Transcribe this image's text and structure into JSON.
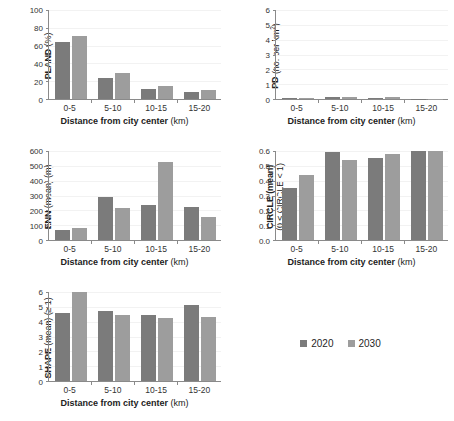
{
  "legend": {
    "items": [
      {
        "label": "2020",
        "color": "#7b7b7b",
        "name": "legend-2020"
      },
      {
        "label": "2030",
        "color": "#9d9d9d",
        "name": "legend-2030"
      }
    ]
  },
  "shared": {
    "categories": [
      "0-5",
      "5-10",
      "10-15",
      "15-20"
    ],
    "xlabel_bold": "Distance from city center",
    "xlabel_unit": "(km)"
  },
  "chart_data": [
    {
      "type": "bar",
      "id": "pland",
      "title": "",
      "ylabel_bold": "PLAND",
      "ylabel_unit": "(%)",
      "xlabel": "Distance from city center (km)",
      "categories": [
        "0-5",
        "5-10",
        "10-15",
        "15-20"
      ],
      "series": [
        {
          "name": "2020",
          "values": [
            64,
            24,
            11,
            8
          ]
        },
        {
          "name": "2030",
          "values": [
            70.5,
            29,
            14.5,
            10.5
          ]
        }
      ],
      "ylim": [
        0,
        100
      ],
      "yticks": [
        0,
        20,
        40,
        60,
        80,
        100
      ],
      "ytick_labels": [
        "0",
        "20",
        "40",
        "60",
        "80",
        "100"
      ],
      "grid": true,
      "legend_position": "external-bottom-right"
    },
    {
      "type": "bar",
      "id": "pd",
      "title": "",
      "ylabel_bold": "PD",
      "ylabel_unit": "(no. per km2)",
      "xlabel": "Distance from city center (km)",
      "categories": [
        "0-5",
        "5-10",
        "10-15",
        "15-20"
      ],
      "series": [
        {
          "name": "2020",
          "values": [
            0.05,
            0.12,
            0.09,
            0.03
          ]
        },
        {
          "name": "2030",
          "values": [
            0.04,
            0.15,
            0.11,
            0.03
          ]
        }
      ],
      "ylim": [
        0,
        6
      ],
      "yticks": [
        0,
        1,
        2,
        3,
        4,
        5,
        6
      ],
      "ytick_labels": [
        "0",
        "1",
        "2",
        "3",
        "4",
        "5",
        "6"
      ],
      "grid": true,
      "legend_position": "external-bottom-right"
    },
    {
      "type": "bar",
      "id": "enn",
      "title": "",
      "ylabel_bold": "ENN",
      "ylabel_unit": "(mean) (m)",
      "xlabel": "Distance from city center (km)",
      "categories": [
        "0-5",
        "5-10",
        "10-15",
        "15-20"
      ],
      "series": [
        {
          "name": "2020",
          "values": [
            70,
            292,
            233,
            223
          ]
        },
        {
          "name": "2030",
          "values": [
            80,
            215,
            523,
            152
          ]
        }
      ],
      "ylim": [
        0,
        600
      ],
      "yticks": [
        0,
        100,
        200,
        300,
        400,
        500,
        600
      ],
      "ytick_labels": [
        "0",
        "100",
        "200",
        "300",
        "400",
        "500",
        "600"
      ],
      "grid": true,
      "legend_position": "external-bottom-right"
    },
    {
      "type": "bar",
      "id": "circle",
      "title": "",
      "ylabel_bold": "CIRCLE (mean)",
      "ylabel_unit": "(0 ≤ CIRCLE < 1)",
      "xlabel": "Distance from city center (km)",
      "categories": [
        "0-5",
        "5-10",
        "10-15",
        "15-20"
      ],
      "series": [
        {
          "name": "2020",
          "values": [
            0.35,
            0.595,
            0.553,
            0.6
          ]
        },
        {
          "name": "2030",
          "values": [
            0.435,
            0.537,
            0.578,
            0.6
          ]
        }
      ],
      "ylim": [
        0,
        0.6
      ],
      "yticks": [
        0,
        0.1,
        0.2,
        0.3,
        0.4,
        0.5,
        0.6
      ],
      "ytick_labels": [
        "0.0",
        "0.1",
        "0.2",
        "0.3",
        "0.4",
        "0.5",
        "0.6"
      ],
      "grid": true,
      "legend_position": "external-bottom-right"
    },
    {
      "type": "bar",
      "id": "shape",
      "title": "",
      "ylabel_bold": "SHAPE",
      "ylabel_unit": "(mean) (≥ 1)",
      "xlabel": "Distance from city center (km)",
      "categories": [
        "0-5",
        "5-10",
        "10-15",
        "15-20"
      ],
      "series": [
        {
          "name": "2020",
          "values": [
            4.58,
            4.75,
            4.47,
            5.13
          ]
        },
        {
          "name": "2030",
          "values": [
            6.0,
            4.45,
            4.23,
            4.3
          ]
        }
      ],
      "ylim": [
        0,
        6
      ],
      "yticks": [
        0,
        1,
        2,
        3,
        4,
        5,
        6
      ],
      "ytick_labels": [
        "0",
        "1",
        "2",
        "3",
        "4",
        "5",
        "6"
      ],
      "grid": true,
      "legend_position": "external-bottom-right"
    }
  ]
}
